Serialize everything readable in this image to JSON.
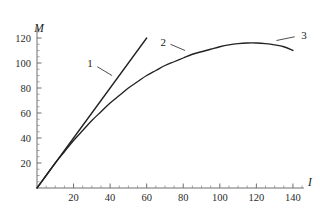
{
  "chart_data": {
    "type": "line",
    "title": "",
    "subtitle": "",
    "xlabel": "I",
    "ylabel": "M",
    "xlim": [
      0,
      146
    ],
    "ylim": [
      0,
      128
    ],
    "grid": false,
    "legend_position": "inline-annotations",
    "x_ticks": [
      20,
      40,
      60,
      80,
      100,
      120,
      140
    ],
    "y_ticks": [
      20,
      40,
      60,
      80,
      100,
      120
    ],
    "x_minor_step": 5,
    "y_minor_step": 5,
    "x_tick_labels": [
      "20",
      "40",
      "60",
      "80",
      "100",
      "120",
      "140"
    ],
    "y_tick_labels": [
      "20",
      "40",
      "60",
      "80",
      "100",
      "120"
    ],
    "series": [
      {
        "name": "1",
        "label": "1",
        "kind": "straight-line",
        "description": "initial tangent / linear asymptote",
        "x": [
          0,
          10,
          20,
          30,
          40,
          50,
          60
        ],
        "y": [
          0,
          20,
          40,
          60,
          80,
          100,
          120
        ]
      },
      {
        "name": "2",
        "label": "2",
        "kind": "saturating-curve",
        "description": "magnetization curve rising then saturating",
        "x": [
          0,
          5,
          10,
          15,
          20,
          25,
          30,
          35,
          40,
          45,
          50,
          55,
          60,
          65,
          70,
          75,
          80,
          85,
          90,
          95,
          100,
          105,
          110,
          115,
          120,
          125,
          130,
          135,
          140
        ],
        "y": [
          0,
          10,
          20,
          29,
          38,
          46,
          54,
          61,
          68,
          74,
          80,
          85,
          90,
          94,
          98,
          101,
          104,
          107,
          109,
          111,
          113,
          114.5,
          115.5,
          116,
          116,
          115.5,
          114.5,
          113,
          110
        ]
      }
    ],
    "annotations": [
      {
        "label": "1",
        "text_x": 29,
        "text_y": 100,
        "leader_from_x": 33,
        "leader_from_y": 97,
        "leader_to_x": 41,
        "leader_to_y": 90
      },
      {
        "label": "2",
        "text_x": 69,
        "text_y": 117,
        "leader_from_x": 73,
        "leader_from_y": 115,
        "leader_to_x": 81,
        "leader_to_y": 110
      },
      {
        "label": "3",
        "text_x": 146,
        "text_y": 122,
        "leader_from_x": 131,
        "leader_from_y": 118,
        "leader_to_x": 141,
        "leader_to_y": 121
      }
    ],
    "colors": {
      "curve": "#222222",
      "axis": "#6e6e6e",
      "text": "#1a1a1a",
      "background": "#ffffff"
    }
  }
}
